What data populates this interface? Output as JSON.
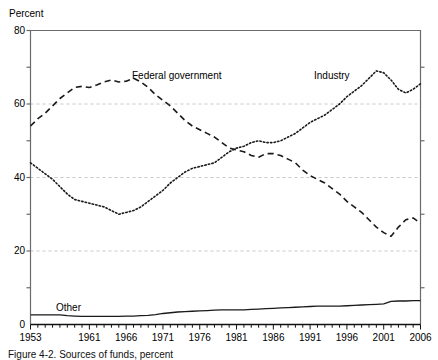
{
  "figure": {
    "caption": "Figure 4-2. Sources of funds, percent"
  },
  "chart_data": {
    "type": "line",
    "title": "",
    "subtitle": "",
    "xlabel": "",
    "ylabel": "Percent",
    "xlim": [
      1953,
      2006
    ],
    "ylim": [
      0,
      80
    ],
    "grid": "horizontal-dashed-at-20-40-60",
    "legend_position": "inline-annotations",
    "y_ticks_major": [
      0,
      20,
      40,
      60,
      80
    ],
    "y_ticks_minor": [
      10,
      30,
      50,
      70
    ],
    "x_ticks_labeled": [
      1953,
      1961,
      1966,
      1971,
      1976,
      1981,
      1986,
      1991,
      1996,
      2001,
      2006
    ],
    "x_tick_interval": 1,
    "x": [
      1953,
      1954,
      1955,
      1956,
      1957,
      1958,
      1959,
      1960,
      1961,
      1962,
      1963,
      1964,
      1965,
      1966,
      1967,
      1968,
      1969,
      1970,
      1971,
      1972,
      1973,
      1974,
      1975,
      1976,
      1977,
      1978,
      1979,
      1980,
      1981,
      1982,
      1983,
      1984,
      1985,
      1986,
      1987,
      1988,
      1989,
      1990,
      1991,
      1992,
      1993,
      1994,
      1995,
      1996,
      1997,
      1998,
      1999,
      2000,
      2001,
      2002,
      2003,
      2004,
      2005,
      2006
    ],
    "series": [
      {
        "name": "Federal government",
        "label": "Federal government",
        "style": "dashed",
        "color": "#1a1a1a",
        "values": [
          54.0,
          56.0,
          57.5,
          59.5,
          61.5,
          63.0,
          64.5,
          64.8,
          64.5,
          65.2,
          66.0,
          66.5,
          66.0,
          66.2,
          67.0,
          66.0,
          64.5,
          62.5,
          61.0,
          59.5,
          57.5,
          55.5,
          54.0,
          53.0,
          52.0,
          51.0,
          49.5,
          48.0,
          47.5,
          47.0,
          46.0,
          45.5,
          46.5,
          46.5,
          46.0,
          45.0,
          44.0,
          42.0,
          40.5,
          39.5,
          38.5,
          37.0,
          35.5,
          33.5,
          32.0,
          30.5,
          28.5,
          26.5,
          25.0,
          24.0,
          26.5,
          28.5,
          29.0,
          27.5
        ]
      },
      {
        "name": "Industry",
        "label": "Industry",
        "style": "dotted",
        "color": "#1a1a1a",
        "values": [
          44.0,
          42.5,
          41.0,
          39.5,
          37.5,
          35.5,
          34.0,
          33.5,
          33.0,
          32.5,
          32.0,
          31.0,
          30.0,
          30.5,
          31.0,
          32.0,
          33.5,
          35.0,
          36.5,
          38.5,
          40.0,
          41.5,
          42.5,
          43.0,
          43.5,
          44.0,
          45.5,
          47.0,
          48.0,
          48.5,
          49.5,
          50.0,
          49.5,
          49.5,
          50.0,
          51.0,
          52.0,
          53.5,
          55.0,
          56.0,
          57.0,
          58.5,
          60.0,
          62.0,
          63.5,
          65.0,
          67.0,
          69.0,
          68.5,
          66.5,
          64.0,
          63.0,
          64.0,
          65.5
        ]
      },
      {
        "name": "Other",
        "label": "Other",
        "style": "solid",
        "color": "#1a1a1a",
        "values": [
          2.6,
          2.6,
          2.6,
          2.6,
          2.6,
          2.4,
          2.3,
          2.2,
          2.2,
          2.2,
          2.2,
          2.2,
          2.2,
          2.3,
          2.3,
          2.4,
          2.5,
          2.7,
          3.0,
          3.2,
          3.4,
          3.5,
          3.6,
          3.7,
          3.8,
          3.9,
          4.0,
          4.0,
          4.0,
          4.0,
          4.1,
          4.2,
          4.3,
          4.4,
          4.5,
          4.6,
          4.7,
          4.8,
          4.9,
          5.0,
          5.0,
          5.0,
          5.0,
          5.1,
          5.2,
          5.3,
          5.4,
          5.5,
          5.6,
          6.3,
          6.4,
          6.4,
          6.5,
          6.5
        ]
      }
    ],
    "annotations": [
      {
        "name": "federal-government-label",
        "text": "Federal government",
        "x_px": 132,
        "y_px": 71
      },
      {
        "name": "industry-label",
        "text": "Industry",
        "x_px": 314,
        "y_px": 71
      },
      {
        "name": "other-label",
        "text": "Other",
        "x_px": 56,
        "y_px": 303
      }
    ]
  },
  "axes": {
    "y_label": "Percent",
    "y_tick_labels": [
      "80",
      "60",
      "40",
      "20",
      "0"
    ],
    "x_tick_labels": [
      "1953",
      "1961",
      "1966",
      "1971",
      "1976",
      "1981",
      "1986",
      "1991",
      "1996",
      "2001",
      "2006"
    ]
  },
  "colors": {
    "axis": "#6b6b6b",
    "grid": "#c8c8c8",
    "line": "#1a1a1a",
    "background": "#ffffff"
  }
}
